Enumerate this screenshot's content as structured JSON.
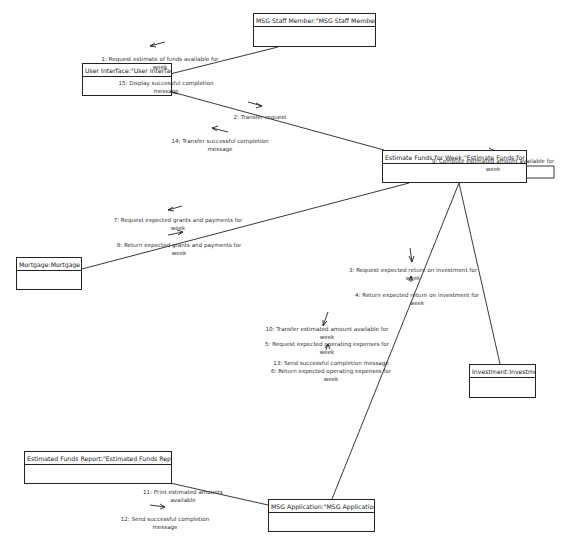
{
  "diagram": {
    "type": "UML collaboration diagram",
    "objects": [
      {
        "id": "staff",
        "label": "MSG Staff Member:\"MSG Staff Member\"",
        "x": 253,
        "y": 13,
        "w": 123,
        "h": 34
      },
      {
        "id": "ui",
        "label": "User Interface:\"User Interface\"",
        "x": 82,
        "y": 63,
        "w": 90,
        "h": 33
      },
      {
        "id": "estimate",
        "label": "Estimate Funds for Week:\"Estimate Funds for Week\"",
        "x": 382,
        "y": 150,
        "w": 145,
        "h": 33
      },
      {
        "id": "mortgage",
        "label": "Mortgage:Mortgage",
        "x": 16,
        "y": 257,
        "w": 66,
        "h": 33
      },
      {
        "id": "investment",
        "label": "Investment:Investment",
        "x": 469,
        "y": 364,
        "w": 67,
        "h": 34
      },
      {
        "id": "report",
        "label": "Estimated Funds Report:\"Estimated Funds Report\"",
        "x": 24,
        "y": 451,
        "w": 148,
        "h": 33
      },
      {
        "id": "msgapp",
        "label": "MSG Application:\"MSG Application\"",
        "x": 268,
        "y": 499,
        "w": 107,
        "h": 33
      }
    ],
    "messages": [
      {
        "id": "m1",
        "text": "1: Request estimate of funds available for week",
        "x": 100,
        "y": 56,
        "w": 120
      },
      {
        "id": "m15",
        "text": "15: Display successful completion message",
        "x": 110,
        "y": 81,
        "w": 110
      },
      {
        "id": "m2",
        "text": "2: Transfer request",
        "x": 220,
        "y": 115,
        "w": 80
      },
      {
        "id": "m14",
        "text": "14: Transfer successful completion message",
        "x": 160,
        "y": 138,
        "w": 115
      },
      {
        "id": "m9",
        "text": "9: Compute estimated amount available for week",
        "x": 425,
        "y": 159,
        "w": 130
      },
      {
        "id": "m7",
        "text": "7: Request expected grants and payments for week",
        "x": 105,
        "y": 218,
        "w": 140
      },
      {
        "id": "m8",
        "text": "8: Return expected grants and payments for week",
        "x": 110,
        "y": 243,
        "w": 135
      },
      {
        "id": "m3",
        "text": "3: Request expected return on investment for week",
        "x": 345,
        "y": 268,
        "w": 130
      },
      {
        "id": "m4",
        "text": "4: Return expected return on investment for week",
        "x": 350,
        "y": 292,
        "w": 130
      },
      {
        "id": "m10",
        "text": "10: Transfer estimated amount available for week",
        "x": 262,
        "y": 326,
        "w": 130
      },
      {
        "id": "m5",
        "text": "5: Request expected operating expenses for week",
        "x": 262,
        "y": 341,
        "w": 130
      },
      {
        "id": "m13",
        "text": "13: Send successful completion message",
        "x": 265,
        "y": 360,
        "w": 128
      },
      {
        "id": "m6",
        "text": "6: Return expected operating expenses for week",
        "x": 265,
        "y": 368,
        "w": 128
      },
      {
        "id": "m11",
        "text": "11: Print estimated amounts available",
        "x": 140,
        "y": 489,
        "w": 85
      },
      {
        "id": "m12",
        "text": "12: Send successful completion message",
        "x": 110,
        "y": 516,
        "w": 110
      }
    ]
  }
}
